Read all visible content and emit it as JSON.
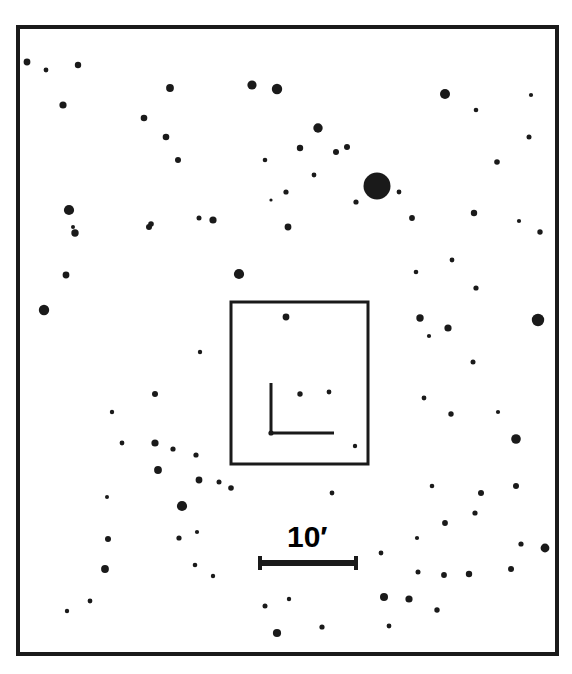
{
  "figure": {
    "kind": "astronomical-finder-chart",
    "background_color": "#ffffff",
    "ink_color": "#1a1a1a",
    "width": 572,
    "height": 674
  },
  "scale_bar": {
    "label": "10",
    "unit_symbol": "′",
    "label_full": "10′",
    "x1": 259,
    "x2": 357,
    "y": 563,
    "line_width": 6,
    "cap_height": 14,
    "label_x": 287,
    "label_y": 522
  },
  "outer_frame": {
    "x": 18,
    "y": 27,
    "width": 539,
    "height": 627,
    "stroke_width": 4
  },
  "inset_box": {
    "x": 231,
    "y": 302,
    "width": 137,
    "height": 162,
    "stroke_width": 3
  },
  "target_marker": {
    "description": "right-angle crosshair pointing at target object",
    "corner_x": 271,
    "corner_y": 433,
    "vertical_top_y": 383,
    "horizontal_right_x": 334,
    "stroke_width": 3,
    "dot_radius": 2.6
  },
  "chart_data": {
    "type": "scatter",
    "title": "",
    "xlabel": "",
    "ylabel": "",
    "grid": false,
    "legend": null,
    "xlim": [
      18,
      557
    ],
    "ylim": [
      27,
      654
    ],
    "point_encoding": "marker radius encodes apparent stellar brightness (larger = brighter)",
    "scale_bar_arcmin": 10,
    "n_points": 96,
    "columns": [
      "x",
      "y",
      "r"
    ],
    "points": [
      [
        27,
        62,
        3.4
      ],
      [
        46,
        70,
        2.4
      ],
      [
        78,
        65,
        3.2
      ],
      [
        63,
        105,
        3.6
      ],
      [
        170,
        88,
        3.9
      ],
      [
        252,
        85,
        4.6
      ],
      [
        277,
        89,
        5.2
      ],
      [
        318,
        128,
        4.7
      ],
      [
        144,
        118,
        3.3
      ],
      [
        166,
        137,
        3.3
      ],
      [
        178,
        160,
        3.0
      ],
      [
        300,
        148,
        3.2
      ],
      [
        336,
        152,
        3.0
      ],
      [
        445,
        94,
        5.0
      ],
      [
        476,
        110,
        2.3
      ],
      [
        531,
        95,
        2.1
      ],
      [
        529,
        137,
        2.5
      ],
      [
        377,
        186,
        13.5
      ],
      [
        356,
        202,
        2.6
      ],
      [
        399,
        192,
        2.4
      ],
      [
        347,
        147,
        3.0
      ],
      [
        69,
        210,
        5.1
      ],
      [
        73,
        227,
        2.0
      ],
      [
        75,
        233,
        3.7
      ],
      [
        151,
        224,
        2.8
      ],
      [
        149,
        227,
        3.0
      ],
      [
        213,
        220,
        3.6
      ],
      [
        288,
        227,
        3.4
      ],
      [
        314,
        175,
        2.4
      ],
      [
        412,
        218,
        2.9
      ],
      [
        474,
        213,
        3.2
      ],
      [
        519,
        221,
        2.1
      ],
      [
        540,
        232,
        2.7
      ],
      [
        66,
        275,
        3.4
      ],
      [
        44,
        310,
        5.2
      ],
      [
        239,
        274,
        5.1
      ],
      [
        271,
        200,
        1.6
      ],
      [
        286,
        192,
        2.6
      ],
      [
        265,
        160,
        2.3
      ],
      [
        199,
        218,
        2.5
      ],
      [
        420,
        318,
        3.7
      ],
      [
        429,
        336,
        2.1
      ],
      [
        448,
        328,
        3.6
      ],
      [
        538,
        320,
        6.2
      ],
      [
        497,
        162,
        2.8
      ],
      [
        416,
        272,
        2.3
      ],
      [
        452,
        260,
        2.4
      ],
      [
        155,
        394,
        3.0
      ],
      [
        473,
        362,
        2.5
      ],
      [
        424,
        398,
        2.4
      ],
      [
        498,
        412,
        2.1
      ],
      [
        476,
        288,
        2.6
      ],
      [
        516,
        439,
        4.8
      ],
      [
        451,
        414,
        2.7
      ],
      [
        112,
        412,
        2.2
      ],
      [
        155,
        443,
        3.6
      ],
      [
        173,
        449,
        2.6
      ],
      [
        158,
        470,
        3.9
      ],
      [
        196,
        455,
        2.6
      ],
      [
        200,
        352,
        2.2
      ],
      [
        182,
        506,
        5.1
      ],
      [
        122,
        443,
        2.4
      ],
      [
        107,
        497,
        2.0
      ],
      [
        108,
        539,
        3.0
      ],
      [
        197,
        532,
        2.1
      ],
      [
        179,
        538,
        2.6
      ],
      [
        105,
        569,
        3.9
      ],
      [
        199,
        480,
        3.4
      ],
      [
        219,
        482,
        2.5
      ],
      [
        231,
        488,
        2.8
      ],
      [
        195,
        565,
        2.3
      ],
      [
        67,
        611,
        2.2
      ],
      [
        90,
        601,
        2.4
      ],
      [
        277,
        633,
        4.1
      ],
      [
        322,
        627,
        2.6
      ],
      [
        389,
        626,
        2.4
      ],
      [
        417,
        538,
        2.1
      ],
      [
        445,
        523,
        2.9
      ],
      [
        481,
        493,
        3.0
      ],
      [
        516,
        486,
        3.0
      ],
      [
        475,
        513,
        2.6
      ],
      [
        409,
        599,
        3.6
      ],
      [
        384,
        597,
        4.0
      ],
      [
        437,
        610,
        2.7
      ],
      [
        418,
        572,
        2.5
      ],
      [
        444,
        575,
        2.9
      ],
      [
        469,
        574,
        3.2
      ],
      [
        511,
        569,
        3.0
      ],
      [
        545,
        548,
        4.4
      ],
      [
        521,
        544,
        2.6
      ],
      [
        432,
        486,
        2.3
      ],
      [
        332,
        493,
        2.4
      ],
      [
        381,
        553,
        2.4
      ],
      [
        213,
        576,
        2.2
      ],
      [
        265,
        606,
        2.5
      ],
      [
        289,
        599,
        2.2
      ]
    ],
    "inset_points": [
      [
        286,
        317,
        3.4
      ],
      [
        300,
        394,
        2.7
      ],
      [
        329,
        392,
        2.4
      ],
      [
        355,
        446,
        2.2
      ]
    ]
  }
}
